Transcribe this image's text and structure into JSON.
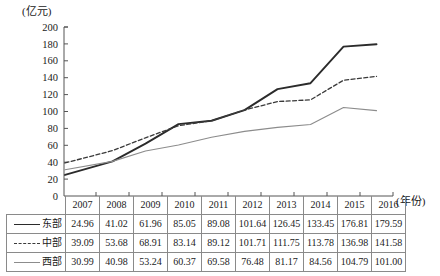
{
  "chart_data": {
    "type": "line",
    "title": "",
    "xlabel": "(年份)",
    "ylabel": "(亿元)",
    "ylim": [
      0,
      200
    ],
    "ytick_step": 20,
    "grid": false,
    "legend_position": "table-left-column",
    "categories": [
      "2007",
      "2008",
      "2009",
      "2010",
      "2011",
      "2012",
      "2013",
      "2014",
      "2015",
      "2016"
    ],
    "yticks": [
      "0",
      "20",
      "40",
      "60",
      "80",
      "100",
      "120",
      "140",
      "160",
      "180",
      "200"
    ],
    "series": [
      {
        "name": "东部",
        "style": "solid-thick",
        "color": "#2b2b2b",
        "values": [
          24.96,
          41.02,
          61.96,
          85.05,
          89.08,
          101.64,
          126.45,
          133.45,
          176.81,
          179.59
        ],
        "labels": [
          "24.96",
          "41.02",
          "61.96",
          "85.05",
          "89.08",
          "101.64",
          "126.45",
          "133.45",
          "176.81",
          "179.59"
        ]
      },
      {
        "name": "中部",
        "style": "dashed",
        "color": "#3a3a3a",
        "values": [
          39.09,
          53.68,
          68.91,
          83.14,
          89.12,
          101.71,
          111.75,
          113.78,
          136.98,
          141.58
        ],
        "labels": [
          "39.09",
          "53.68",
          "68.91",
          "83.14",
          "89.12",
          "101.71",
          "111.75",
          "113.78",
          "136.98",
          "141.58"
        ]
      },
      {
        "name": "西部",
        "style": "solid-thin",
        "color": "#8c8c8c",
        "values": [
          30.99,
          40.98,
          53.24,
          60.37,
          69.58,
          76.48,
          81.17,
          84.56,
          104.79,
          101.0
        ],
        "labels": [
          "30.99",
          "40.98",
          "53.24",
          "60.37",
          "69.58",
          "76.48",
          "81.17",
          "84.56",
          "104.79",
          "101.00"
        ]
      }
    ]
  },
  "axis": {
    "unit_y": "(亿元)",
    "unit_x": "(年份)"
  },
  "table": {
    "year_headers": [
      "2007",
      "2008",
      "2009",
      "2010",
      "2011",
      "2012",
      "2013",
      "2014",
      "2015",
      "2016"
    ],
    "rows": [
      {
        "label": "东部",
        "values": [
          "24.96",
          "41.02",
          "61.96",
          "85.05",
          "89.08",
          "101.64",
          "126.45",
          "133.45",
          "176.81",
          "179.59"
        ]
      },
      {
        "label": "中部",
        "values": [
          "39.09",
          "53.68",
          "68.91",
          "83.14",
          "89.12",
          "101.71",
          "111.75",
          "113.78",
          "136.98",
          "141.58"
        ]
      },
      {
        "label": "西部",
        "values": [
          "30.99",
          "40.98",
          "53.24",
          "60.37",
          "69.58",
          "76.48",
          "81.17",
          "84.56",
          "104.79",
          "101.00"
        ]
      }
    ]
  }
}
